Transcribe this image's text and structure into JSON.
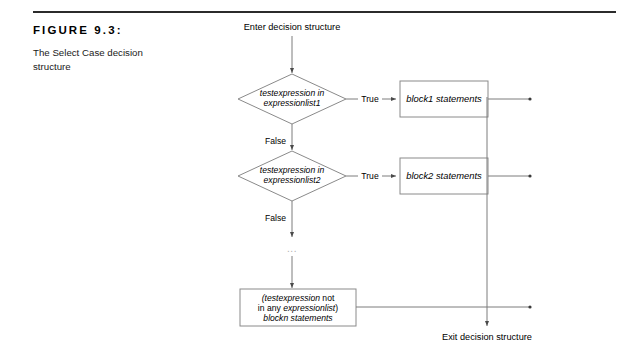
{
  "figure": {
    "label": "FIGURE 9.3:",
    "description": "The Select Case decision structure"
  },
  "diagram": {
    "type": "flowchart",
    "entry_label": "Enter decision structure",
    "exit_label": "Exit decision structure",
    "ellipsis": "...",
    "decisions": [
      {
        "id": "decision-1",
        "line1": "testexpression in",
        "line2": "expressionlist1",
        "true_label": "True",
        "false_label": "False",
        "true_target": "block1-box"
      },
      {
        "id": "decision-2",
        "line1": "testexpression in",
        "line2": "expressionlist2",
        "true_label": "True",
        "false_label": "False",
        "true_target": "block2-box"
      }
    ],
    "process_boxes": [
      {
        "id": "block1-box",
        "label": "block1 statements"
      },
      {
        "id": "block2-box",
        "label": "block2 statements"
      }
    ],
    "default_box": {
      "id": "blockn-box",
      "line1_italic": "(testexpression",
      "line1_roman": " not",
      "line2_roman": "in any ",
      "line2_italic": "expressionlist",
      "line2_close": ")",
      "line3_italic": "blockn statements"
    },
    "colors": {
      "shape_stroke": "#8a8a8a",
      "connector": "#7d7d7d",
      "text": "#000000",
      "rule": "#2b2b2b",
      "ellipsis": "#b0b0b0"
    }
  }
}
